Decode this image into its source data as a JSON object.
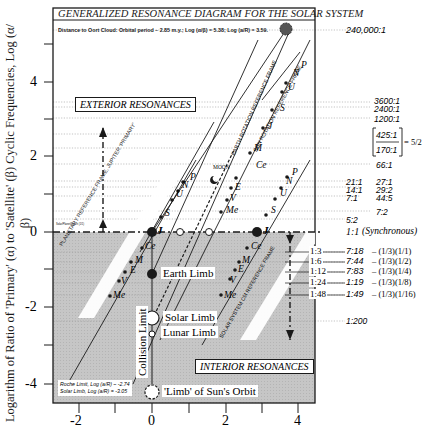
{
  "title": "GENERALIZED RESONANCE DIAGRAM FOR THE SOLAR SYSTEM",
  "oort_note": "Distance to Oort Cloud: Orbital period ~ 2.85 m.y.; Log (α/β) = 5.38; Log (a/R) = 3.59.",
  "y_axis_label": "Logarithm of Ratio of 'Primary' (α) to 'Satellite' (β) Cyclic Frequencies, Log (α/β)",
  "x_ticks": [
    "-2",
    "0",
    "2",
    "4"
  ],
  "y_ticks": [
    "4",
    "2",
    "0",
    "-2",
    "-4"
  ],
  "boxes": {
    "exterior": "EXTERIOR RESONANCES",
    "interior": "INTERIOR RESONANCES"
  },
  "frames": {
    "planetary": "PLANETARY REFERENCE FRAME, JUPITER 'PRIMARY'",
    "earth": "EARTH ROTATION REFERENCE FRAME",
    "sun": "SUN ROTATION REFERENCE FRAME",
    "solar_cm": "SOLAR SYSTEM CM REFERENCE FRAME"
  },
  "labels": {
    "moon": "MOON",
    "earth_limb": "Earth Limb",
    "solar_limb": "Solar Limb",
    "lunar_limb": "Lunar Limb",
    "collision_limit": "Collision Limit",
    "sun_orbit_limb": "'Limb' of Sun's Orbit",
    "roche_limit": "Roche Limit, Log (a/R) ~ -2.74",
    "solar_limit": "Solar Limb, Log (a/R) = -3.05",
    "small_note": "Solar/Planet/Synch (1/1)"
  },
  "planets_upper": [
    "J",
    "S",
    "U",
    "N",
    "P"
  ],
  "planets_lower": [
    "Ce",
    "M",
    "E",
    "V",
    "Me"
  ],
  "sun_frame_planets": [
    "Me",
    "V",
    "E",
    "M",
    "Ce",
    "J",
    "S",
    "U"
  ],
  "right_ratios": {
    "r240000": "240,000:1",
    "r3600": "3600:1",
    "r2400": "2400:1",
    "r1200": "1200:1",
    "r425": "425:1",
    "r170": "170:1",
    "eq52": "= 5/2",
    "r66": "66:1",
    "r21": "21:1",
    "r27": "27:1",
    "r14": "14:1",
    "r29_2": "29:2",
    "r7": "7:1",
    "r44_5": "44:5",
    "r7_2": "7:2",
    "r5_2": "5:2",
    "synch": "1:1",
    "synch_note": "(Synchronous)",
    "r1_200": "1:200"
  },
  "interior_rows": [
    {
      "ratio": "1:3",
      "value": "7:18",
      "formula": "– (1/3)(1/1)"
    },
    {
      "ratio": "1:6",
      "value": "7:44",
      "formula": "– (1/3)(1/2)"
    },
    {
      "ratio": "1:12",
      "value": "7:83",
      "formula": "– (1/3)(1/4)"
    },
    {
      "ratio": "1:24",
      "value": "1:19",
      "formula": "– (1/3)(1/8)"
    },
    {
      "ratio": "1:48",
      "value": "1:49",
      "formula": "– (1/3)(1/16)"
    }
  ],
  "colors": {
    "shade": "#c8c8c8",
    "ink": "#1a1a1a",
    "grid": "#9a9a9a"
  }
}
